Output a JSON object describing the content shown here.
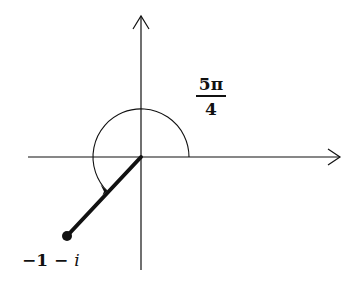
{
  "diagram": {
    "angle_label": {
      "numerator": "5π",
      "denominator": "4"
    },
    "point_label": {
      "real": "−1 −",
      "imag": "i"
    },
    "colors": {
      "stroke": "#111111",
      "background": "#ffffff"
    }
  }
}
